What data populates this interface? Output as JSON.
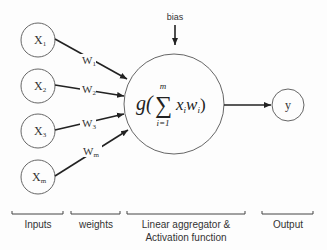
{
  "diagram": {
    "type": "perceptron / artificial neuron",
    "bias_label": "bias",
    "inputs": [
      {
        "id": "x1",
        "label": "X",
        "sub": "1"
      },
      {
        "id": "x2",
        "label": "X",
        "sub": "2"
      },
      {
        "id": "x3",
        "label": "X",
        "sub": "3"
      },
      {
        "id": "xm",
        "label": "X",
        "sub": "m"
      }
    ],
    "weights": [
      {
        "id": "w1",
        "label": "W",
        "sub": "1"
      },
      {
        "id": "w2",
        "label": "W",
        "sub": "2"
      },
      {
        "id": "w3",
        "label": "W",
        "sub": "3"
      },
      {
        "id": "wm",
        "label": "W",
        "sub": "m"
      }
    ],
    "neuron": {
      "func": "g(",
      "sum_symbol": "∑",
      "upper": "m",
      "lower": "i=1",
      "term": "x",
      "term_sub": "i",
      "term2": "w",
      "term2_sub": "i",
      "close": ")"
    },
    "output": {
      "label": "y"
    },
    "sections": [
      {
        "id": "inputs",
        "label": "Inputs"
      },
      {
        "id": "weights",
        "label": "weights"
      },
      {
        "id": "aggregator",
        "label_line1": "Linear aggregator &",
        "label_line2": "Activation function"
      },
      {
        "id": "output",
        "label": "Output"
      }
    ],
    "colors": {
      "stroke": "#222222",
      "circle": "#555555",
      "text": "#333333"
    }
  }
}
